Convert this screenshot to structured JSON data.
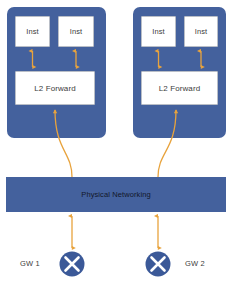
{
  "diagram": {
    "colors": {
      "host_fill": "#44619d",
      "box_fill": "#ffffff",
      "box_border": "#b9bec7",
      "connector": "#e8a33d",
      "text_dark": "#3c3c3c",
      "text_on_blue": "#12172a",
      "gw_fill": "#3b5998",
      "gw_glyph": "#ffffff"
    },
    "hosts": [
      {
        "name": "host-left",
        "instances": [
          {
            "label": "Inst"
          },
          {
            "label": "Inst"
          }
        ],
        "forwarder": {
          "label": "L2 Forward"
        }
      },
      {
        "name": "host-right",
        "instances": [
          {
            "label": "Inst"
          },
          {
            "label": "Inst"
          }
        ],
        "forwarder": {
          "label": "L2 Forward"
        }
      }
    ],
    "physical_network": {
      "label": "Physical Networking"
    },
    "gateways": [
      {
        "label": "GW 1",
        "glyph": "X",
        "icon": "gateway-x-icon"
      },
      {
        "label": "GW 2",
        "glyph": "X",
        "icon": "gateway-x-icon"
      }
    ],
    "connectors": {
      "inst_to_forward": "bidirectional",
      "forward_to_physical": "up-arrow",
      "physical_to_gateway": "bidirectional"
    }
  }
}
